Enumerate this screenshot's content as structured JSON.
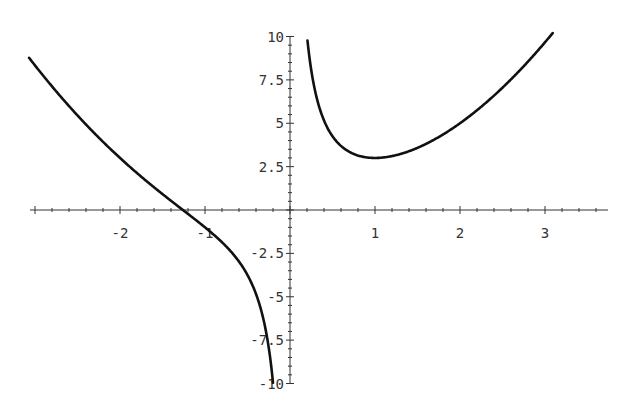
{
  "chart_data": {
    "type": "line",
    "title": "",
    "xlabel": "",
    "ylabel": "",
    "function": "x^2 + 2/x",
    "xlim": [
      -3.07,
      3.1
    ],
    "ylim": [
      -10,
      10
    ],
    "grid": false,
    "legend": null,
    "x_ticks": [
      {
        "value": -2,
        "label": "-2"
      },
      {
        "value": -1,
        "label": "-1"
      },
      {
        "value": 1,
        "label": "1"
      },
      {
        "value": 2,
        "label": "2"
      },
      {
        "value": 3,
        "label": "3"
      }
    ],
    "y_ticks": [
      {
        "value": 10,
        "label": "10"
      },
      {
        "value": 7.5,
        "label": "7.5"
      },
      {
        "value": 5,
        "label": "5"
      },
      {
        "value": 2.5,
        "label": "2.5"
      },
      {
        "value": -2.5,
        "label": "-2.5"
      },
      {
        "value": -5,
        "label": "-5"
      },
      {
        "value": -7.5,
        "label": "-7.5"
      },
      {
        "value": -10,
        "label": "-10"
      }
    ],
    "series": [
      {
        "name": "left branch",
        "x": [
          -3.05,
          -2.5,
          -2,
          -1.5,
          -1.26,
          -1,
          -0.75,
          -0.5,
          -0.3,
          -0.2
        ],
        "y": [
          8.65,
          5.45,
          3.0,
          0.92,
          0.0,
          -1.0,
          -2.1,
          -3.75,
          -6.58,
          -9.96
        ]
      },
      {
        "name": "right branch",
        "x": [
          0.2,
          0.3,
          0.5,
          0.75,
          1,
          1.5,
          2,
          2.5,
          3,
          3.1
        ],
        "y": [
          10.04,
          6.76,
          4.25,
          3.23,
          3.0,
          3.58,
          5.0,
          7.05,
          9.67,
          10.25
        ]
      }
    ],
    "annotations": [
      {
        "text": "minimum",
        "x": 1,
        "y": 3
      }
    ]
  },
  "colors": {
    "curve": "#111111",
    "axis": "#333333",
    "background": "#ffffff"
  }
}
